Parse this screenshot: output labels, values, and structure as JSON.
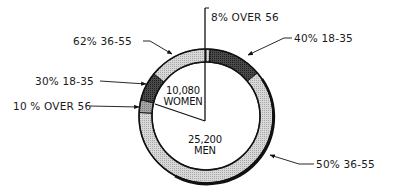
{
  "chart_data": {
    "type": "pie",
    "title": "",
    "subtitle": "",
    "inner_pie": {
      "categories": [
        "Women",
        "Men"
      ],
      "values": [
        10080,
        25200
      ],
      "labels": [
        "10,080 WOMEN",
        "25,200 MEN"
      ]
    },
    "outer_ring": {
      "women": {
        "categories": [
          "36-55",
          "18-35",
          "Over 56"
        ],
        "percent": [
          62,
          30,
          10
        ],
        "labels": [
          "62% 36-55",
          "30% 18-35",
          "10% OVER 56"
        ]
      },
      "men": {
        "categories": [
          "Over 56",
          "18-35",
          "36-55"
        ],
        "percent": [
          8,
          40,
          50
        ],
        "labels": [
          "8% OVER 56",
          "40% 18-35",
          "50% 36-55"
        ]
      }
    },
    "legend": null,
    "grid": false
  },
  "labels": {
    "women_36_55": "62% 36-55",
    "women_18_35": "30% 18-35",
    "women_over_56": "10 % OVER 56",
    "men_over_56": "8% OVER 56",
    "men_18_35": "40% 18-35",
    "men_36_55": "50% 36-55",
    "women_count": "10,080",
    "women_word": "WOMEN",
    "men_count": "25,200",
    "men_word": "MEN"
  },
  "colors": {
    "light": "#cfcfcf",
    "medium": "#9a9a9a",
    "dark": "#3a3a3a",
    "outline": "#111111"
  }
}
